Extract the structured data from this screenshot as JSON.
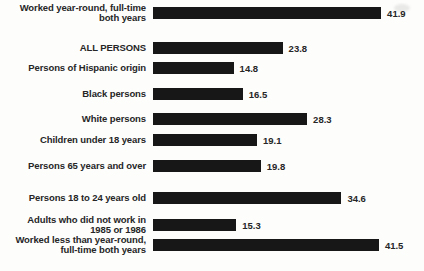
{
  "chart_data": {
    "type": "bar",
    "orientation": "horizontal",
    "title": "",
    "categories": [
      "ALL PERSONS",
      "Persons of Hispanic origin",
      "Black persons",
      "White persons",
      "Children under 18 years",
      "Persons 65 years and over",
      "Persons 18 to 24 years old",
      "Adults who did not work in\n1985 or 1986",
      "Worked less than year-round,\nfull-time both years",
      "Worked year-round, full-time\nboth years"
    ],
    "values": [
      23.8,
      14.8,
      16.5,
      28.3,
      19.1,
      19.8,
      34.6,
      15.3,
      41.5,
      41.9
    ],
    "xlim": [
      0,
      45
    ],
    "grid": false,
    "legend": false,
    "value_labels_shown": true,
    "bar_color": "#171717",
    "text_color": "#262626",
    "background_color": "#fdfdfc"
  }
}
